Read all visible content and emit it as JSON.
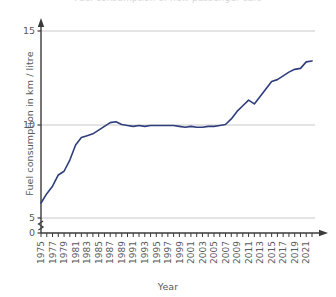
{
  "title_fragment": "Fuel consumption of new passenger cars",
  "axis_titles": {
    "x": "Year",
    "y": "Fuel consumption in km / litre"
  },
  "colors": {
    "line": "#2e3d7c",
    "axis": "#3a3a3a",
    "grid": "#c9c9c9",
    "text": "#58595b",
    "background": "#ffffff"
  },
  "chart_data": {
    "type": "line",
    "title": "Fuel consumption of new passenger cars",
    "xlabel": "Year",
    "ylabel": "Fuel consumption in km / litre",
    "xlim": [
      1975,
      2022
    ],
    "ylim": [
      5,
      15
    ],
    "y_axis_break": true,
    "y_axis_break_between": [
      0,
      5
    ],
    "grid": true,
    "grid_axis": "y",
    "legend": false,
    "yticks": [
      0,
      5,
      10,
      15
    ],
    "ytick_labels": [
      "0",
      "5",
      "10",
      "15"
    ],
    "xticks": [
      1975,
      1977,
      1979,
      1981,
      1983,
      1985,
      1987,
      1989,
      1991,
      1993,
      1995,
      1997,
      1999,
      2001,
      2003,
      2005,
      2007,
      2009,
      2011,
      2013,
      2015,
      2017,
      2019,
      2021
    ],
    "xtick_labels": [
      "1975",
      "1977",
      "1979",
      "1981",
      "1983",
      "1985",
      "1987",
      "1989",
      "1991",
      "1993",
      "1995",
      "1997",
      "1999",
      "2001",
      "2003",
      "2005",
      "2007",
      "2009",
      "2011",
      "2013",
      "2015",
      "2017",
      "2019",
      "2021"
    ],
    "xtick_minor_every": 1,
    "series": [
      {
        "name": "Fuel consumption",
        "color": "#2e3d7c",
        "x": [
          1975,
          1976,
          1977,
          1978,
          1979,
          1980,
          1981,
          1982,
          1983,
          1984,
          1985,
          1986,
          1987,
          1988,
          1989,
          1990,
          1991,
          1992,
          1993,
          1994,
          1995,
          1996,
          1997,
          1998,
          1999,
          2000,
          2001,
          2002,
          2003,
          2004,
          2005,
          2006,
          2007,
          2008,
          2009,
          2010,
          2011,
          2012,
          2013,
          2014,
          2015,
          2016,
          2017,
          2018,
          2019,
          2020,
          2021,
          2022
        ],
        "values": [
          5.8,
          6.3,
          6.7,
          7.3,
          7.5,
          8.1,
          8.9,
          9.3,
          9.4,
          9.5,
          9.7,
          9.9,
          10.1,
          10.15,
          10.0,
          9.95,
          9.9,
          9.95,
          9.9,
          9.95,
          9.95,
          9.95,
          9.95,
          9.95,
          9.9,
          9.85,
          9.9,
          9.85,
          9.85,
          9.9,
          9.9,
          9.95,
          10.0,
          10.3,
          10.7,
          11.0,
          11.3,
          11.1,
          11.5,
          11.9,
          12.3,
          12.4,
          12.6,
          12.8,
          12.95,
          13.0,
          13.35,
          13.4
        ]
      }
    ]
  }
}
